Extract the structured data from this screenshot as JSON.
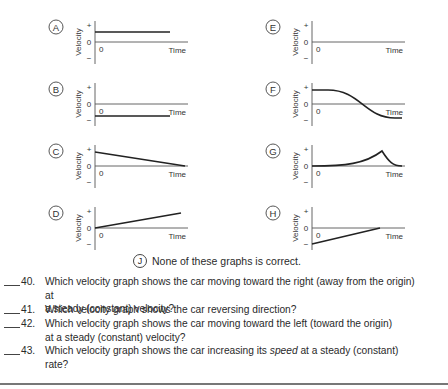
{
  "graphs": [
    {
      "id": "A",
      "type": "constant-positive",
      "axis_label": "Velocity",
      "x_label": "Time",
      "ticks": [
        "+",
        "0",
        "−"
      ],
      "origin": "0"
    },
    {
      "id": "B",
      "type": "constant-negative",
      "axis_label": "Velocity",
      "x_label": "Time",
      "ticks": [
        "+",
        "0",
        "−"
      ],
      "origin": "0"
    },
    {
      "id": "C",
      "type": "linear-decreasing-positive-to-zero",
      "axis_label": "Velocity",
      "x_label": "Time",
      "ticks": [
        "+",
        "0",
        "−"
      ],
      "origin": "0"
    },
    {
      "id": "D",
      "type": "linear-increasing-from-zero",
      "axis_label": "Velocity",
      "x_label": "Time",
      "ticks": [
        "+",
        "0",
        "−"
      ],
      "origin": "0"
    },
    {
      "id": "E",
      "type": "zero",
      "axis_label": "Velocity",
      "x_label": "Time",
      "ticks": [
        "+",
        "0",
        "−"
      ],
      "origin": "0"
    },
    {
      "id": "F",
      "type": "smooth-positive-to-negative",
      "axis_label": "Velocity",
      "x_label": "Time",
      "ticks": [
        "+",
        "0",
        "−"
      ],
      "origin": "0"
    },
    {
      "id": "G",
      "type": "cusp-peak",
      "axis_label": "Velocity",
      "x_label": "Time",
      "ticks": [
        "+",
        "0",
        "−"
      ],
      "origin": "0"
    },
    {
      "id": "H",
      "type": "linear-negative-to-zero",
      "axis_label": "Velocity",
      "x_label": "Time",
      "ticks": [
        "+",
        "0",
        "−"
      ],
      "origin": "0"
    }
  ],
  "none_option": {
    "id": "J",
    "text": "None of these graphs is correct."
  },
  "questions": [
    {
      "num": "40.",
      "lines": [
        "Which velocity graph shows the car moving toward the right (away from the origin) at",
        "a steady (constant) velocity?"
      ]
    },
    {
      "num": "41.",
      "lines": [
        "Which velocity graph shows the car reversing direction?"
      ]
    },
    {
      "num": "42.",
      "lines": [
        "Which velocity graph shows the car moving toward the left (toward the origin)",
        "at a steady (constant) velocity?"
      ]
    },
    {
      "num": "43.",
      "lines_html": true,
      "pre": "Which velocity graph shows the car increasing its ",
      "em": "speed",
      "post": " at a steady (constant)",
      "line2": "rate?"
    }
  ]
}
